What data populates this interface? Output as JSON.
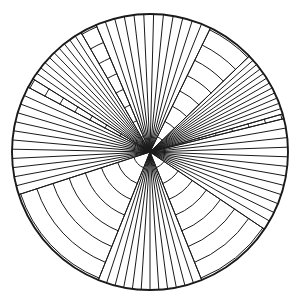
{
  "figure": {
    "type": "line-art",
    "background_color": "#ffffff",
    "stroke_color": "#1a1a1a",
    "canvas": {
      "width": 302,
      "height": 304
    }
  },
  "chart_data": {
    "type": "scatter",
    "subtitle": "",
    "xlabel": "",
    "ylabel": "",
    "grid": false,
    "legend": null,
    "geometry": {
      "center_x": 150,
      "center_y": 152,
      "radius": 138,
      "outer_circle_stroke_width": 1.9,
      "inner_stroke_width": 1.0,
      "sector_count": 6,
      "arc_ring_count": 8,
      "arc_ring_radii": [
        17,
        34,
        51,
        68,
        85,
        102,
        119,
        136
      ],
      "fan_line_counts": [
        13,
        13,
        13,
        13,
        13,
        13
      ]
    },
    "fan_sectors": [
      {
        "name": "sector-top",
        "start_angle_deg": -113,
        "end_angle_deg": -64,
        "line_count": 13
      },
      {
        "name": "sector-upper-right",
        "start_angle_deg": -44,
        "end_angle_deg": -16,
        "line_count": 13
      },
      {
        "name": "sector-right",
        "start_angle_deg": -14,
        "end_angle_deg": 34,
        "line_count": 13
      },
      {
        "name": "sector-bottom",
        "start_angle_deg": 68,
        "end_angle_deg": 112,
        "line_count": 13
      },
      {
        "name": "sector-left",
        "start_angle_deg": 162,
        "end_angle_deg": 208,
        "line_count": 13
      },
      {
        "name": "sector-upper-left-thin",
        "start_angle_deg": 212,
        "end_angle_deg": 240,
        "line_count": 11
      }
    ],
    "arc_sectors": [
      {
        "name": "arc-band-upper-right",
        "start_angle_deg": -64,
        "end_angle_deg": -14,
        "ring_count": 8
      },
      {
        "name": "arc-band-right-lower",
        "start_angle_deg": 34,
        "end_angle_deg": 68,
        "ring_count": 8
      },
      {
        "name": "arc-band-lower-left",
        "start_angle_deg": 112,
        "end_angle_deg": 162,
        "ring_count": 8
      },
      {
        "name": "arc-band-upper-left",
        "start_angle_deg": 240,
        "end_angle_deg": 247,
        "ring_count": 8
      }
    ]
  }
}
